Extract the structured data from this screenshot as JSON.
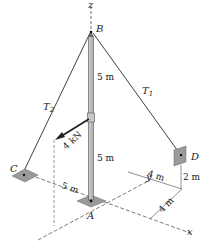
{
  "diagram": {
    "points": {
      "A": "A",
      "B": "B",
      "C": "C",
      "D": "D"
    },
    "axes": {
      "x": "x",
      "y": "y",
      "z": "z"
    },
    "cables": {
      "T1": "T",
      "T1_sub": "1",
      "T2": "T",
      "T2_sub": "2"
    },
    "force": {
      "label": "4 kN"
    },
    "dimensions": {
      "pole_upper": "5 m",
      "pole_lower": "5 m",
      "AC": "5 m",
      "y_offset_D": "4 m",
      "x_offset_D": "4 m",
      "D_height": "2 m"
    },
    "colors": {
      "line": "#2a2a2a",
      "plate": "#9a9a9a",
      "pole": "#b4b4b4",
      "pole_edge": "#555555"
    }
  }
}
